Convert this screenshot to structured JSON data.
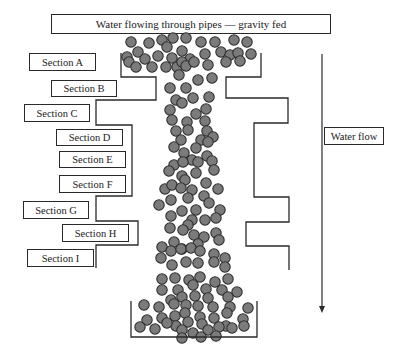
{
  "title": "Water flowing through pipes — gravity fed",
  "flow_label": "Water flow",
  "sections": [
    {
      "label": "Section A",
      "x": 29,
      "y": 53,
      "w": 67,
      "h": 18
    },
    {
      "label": "Section B",
      "x": 51,
      "y": 80,
      "w": 66,
      "h": 17
    },
    {
      "label": "Section C",
      "x": 24,
      "y": 104,
      "w": 66,
      "h": 18
    },
    {
      "label": "Section D",
      "x": 56,
      "y": 129,
      "w": 67,
      "h": 17
    },
    {
      "label": "Section E",
      "x": 59,
      "y": 151,
      "w": 67,
      "h": 17
    },
    {
      "label": "Section F",
      "x": 59,
      "y": 175,
      "w": 67,
      "h": 18
    },
    {
      "label": "Section G",
      "x": 23,
      "y": 201,
      "w": 66,
      "h": 18
    },
    {
      "label": "Section H",
      "x": 62,
      "y": 224,
      "w": 67,
      "h": 18
    },
    {
      "label": "Section I",
      "x": 27,
      "y": 249,
      "w": 67,
      "h": 18
    }
  ],
  "colors": {
    "ball_fill": "#7b7b7b",
    "ball_stroke": "#2e2e2e",
    "line": "#2a2a2a"
  },
  "balls": [
    [
      131,
      42
    ],
    [
      149,
      43
    ],
    [
      162,
      40
    ],
    [
      173,
      38
    ],
    [
      186,
      38
    ],
    [
      201,
      42
    ],
    [
      215,
      42
    ],
    [
      234,
      40
    ],
    [
      247,
      42
    ],
    [
      127,
      57
    ],
    [
      138,
      52
    ],
    [
      145,
      59
    ],
    [
      158,
      56
    ],
    [
      167,
      47
    ],
    [
      172,
      58
    ],
    [
      182,
      51
    ],
    [
      190,
      59
    ],
    [
      205,
      54
    ],
    [
      221,
      52
    ],
    [
      230,
      55
    ],
    [
      238,
      53
    ],
    [
      251,
      54
    ],
    [
      129,
      62
    ],
    [
      136,
      67
    ],
    [
      152,
      67
    ],
    [
      166,
      67
    ],
    [
      177,
      67
    ],
    [
      182,
      62
    ],
    [
      186,
      66
    ],
    [
      194,
      62
    ],
    [
      208,
      65
    ],
    [
      226,
      62
    ],
    [
      240,
      61
    ],
    [
      179,
      75
    ],
    [
      198,
      80
    ],
    [
      212,
      78
    ],
    [
      170,
      88
    ],
    [
      186,
      88
    ],
    [
      176,
      100
    ],
    [
      193,
      98
    ],
    [
      209,
      97
    ],
    [
      170,
      110
    ],
    [
      182,
      103
    ],
    [
      196,
      114
    ],
    [
      206,
      109
    ],
    [
      172,
      120
    ],
    [
      187,
      122
    ],
    [
      205,
      121
    ],
    [
      176,
      131
    ],
    [
      188,
      130
    ],
    [
      207,
      131
    ],
    [
      181,
      140
    ],
    [
      201,
      140
    ],
    [
      213,
      137
    ],
    [
      184,
      153
    ],
    [
      196,
      148
    ],
    [
      208,
      142
    ],
    [
      174,
      147
    ],
    [
      192,
      160
    ],
    [
      207,
      156
    ],
    [
      174,
      165
    ],
    [
      183,
      162
    ],
    [
      198,
      162
    ],
    [
      212,
      161
    ],
    [
      169,
      171
    ],
    [
      182,
      176
    ],
    [
      196,
      173
    ],
    [
      214,
      170
    ],
    [
      165,
      189
    ],
    [
      172,
      185
    ],
    [
      185,
      180
    ],
    [
      181,
      188
    ],
    [
      192,
      190
    ],
    [
      206,
      183
    ],
    [
      218,
      189
    ],
    [
      171,
      200
    ],
    [
      188,
      198
    ],
    [
      204,
      196
    ],
    [
      159,
      205
    ],
    [
      182,
      211
    ],
    [
      196,
      210
    ],
    [
      209,
      203
    ],
    [
      220,
      210
    ],
    [
      192,
      220
    ],
    [
      205,
      220
    ],
    [
      216,
      218
    ],
    [
      171,
      216
    ],
    [
      188,
      225
    ],
    [
      170,
      228
    ],
    [
      183,
      230
    ],
    [
      194,
      235
    ],
    [
      174,
      242
    ],
    [
      182,
      249
    ],
    [
      204,
      237
    ],
    [
      216,
      233
    ],
    [
      219,
      240
    ],
    [
      198,
      244
    ],
    [
      162,
      247
    ],
    [
      171,
      251
    ],
    [
      181,
      249
    ],
    [
      191,
      248
    ],
    [
      200,
      251
    ],
    [
      214,
      254
    ],
    [
      161,
      258
    ],
    [
      172,
      265
    ],
    [
      186,
      262
    ],
    [
      198,
      263
    ],
    [
      214,
      262
    ],
    [
      225,
      258
    ],
    [
      225,
      267
    ],
    [
      162,
      279
    ],
    [
      175,
      278
    ],
    [
      189,
      280
    ],
    [
      200,
      277
    ],
    [
      215,
      282
    ],
    [
      228,
      279
    ],
    [
      162,
      290
    ],
    [
      178,
      290
    ],
    [
      193,
      285
    ],
    [
      206,
      289
    ],
    [
      222,
      290
    ],
    [
      237,
      292
    ],
    [
      171,
      300
    ],
    [
      182,
      297
    ],
    [
      195,
      296
    ],
    [
      208,
      298
    ],
    [
      228,
      297
    ],
    [
      144,
      305
    ],
    [
      159,
      307
    ],
    [
      174,
      304
    ],
    [
      186,
      305
    ],
    [
      198,
      306
    ],
    [
      213,
      307
    ],
    [
      230,
      307
    ],
    [
      248,
      308
    ],
    [
      147,
      320
    ],
    [
      162,
      318
    ],
    [
      175,
      316
    ],
    [
      185,
      313
    ],
    [
      200,
      317
    ],
    [
      214,
      318
    ],
    [
      227,
      313
    ],
    [
      243,
      319
    ],
    [
      176,
      326
    ],
    [
      188,
      322
    ],
    [
      202,
      324
    ],
    [
      226,
      326
    ],
    [
      140,
      327
    ],
    [
      155,
      329
    ],
    [
      167,
      323
    ],
    [
      182,
      330
    ],
    [
      193,
      333
    ],
    [
      208,
      330
    ],
    [
      219,
      327
    ],
    [
      232,
      328
    ],
    [
      244,
      326
    ],
    [
      182,
      338
    ],
    [
      201,
      337
    ],
    [
      216,
      336
    ]
  ]
}
